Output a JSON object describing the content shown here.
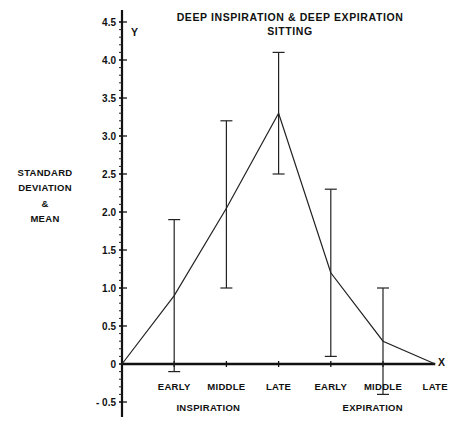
{
  "chart_data": {
    "type": "line",
    "title": "DEEP INSPIRATION & DEEP EXPIRATION",
    "subtitle": "SITTING",
    "ylabel_lines": [
      "STANDARD",
      "DEVIATION",
      "&",
      "MEAN"
    ],
    "y_axis_letter": "Y",
    "x_axis_letter": "X",
    "ylim": [
      -0.5,
      4.5
    ],
    "y_major_step": 0.5,
    "y_minor_step": 0.1,
    "y_tick_labels": [
      "- 0.5",
      "0",
      "0.5",
      "1.0",
      "1.5",
      "2.0",
      "2.5",
      "3.0",
      "3.5",
      "4.0",
      "4.5"
    ],
    "y_tick_values": [
      -0.5,
      0,
      0.5,
      1.0,
      1.5,
      2.0,
      2.5,
      3.0,
      3.5,
      4.0,
      4.5
    ],
    "x": [
      0,
      1,
      2,
      3,
      4,
      5,
      6
    ],
    "categories": [
      "",
      "EARLY",
      "MIDDLE",
      "LATE",
      "EARLY",
      "MIDDLE",
      "LATE"
    ],
    "groups": [
      {
        "label": "INSPIRATION",
        "center": 1.75
      },
      {
        "label": "EXPIRATION",
        "center": 4.9
      }
    ],
    "grid": false,
    "series": [
      {
        "name": "Mean",
        "values": [
          0,
          0.9,
          2.05,
          3.3,
          1.2,
          0.3,
          0
        ],
        "error_low": [
          null,
          -0.1,
          1.0,
          2.5,
          0.1,
          -0.4,
          null
        ],
        "error_high": [
          null,
          1.9,
          3.2,
          4.1,
          2.3,
          1.0,
          null
        ]
      }
    ]
  }
}
